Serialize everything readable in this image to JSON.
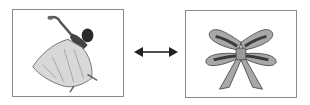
{
  "left_image": {
    "subject": "ballerina-dancer",
    "icon": "dancer-icon"
  },
  "right_image": {
    "subject": "ribbon-bow",
    "icon": "bow-icon"
  },
  "connector": {
    "icon": "double-arrow-icon",
    "color": "#222222"
  },
  "colors": {
    "frame": "#8a8a8a",
    "bow_fill": "#a8a8a8",
    "bow_dark": "#3a3a3a"
  }
}
